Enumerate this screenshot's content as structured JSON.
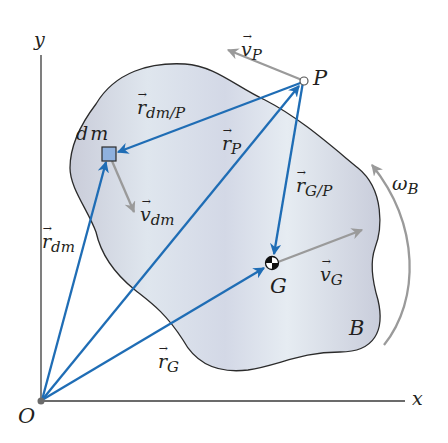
{
  "figure": {
    "axes": {
      "x_label": "x",
      "y_label": "y",
      "origin_label": "O"
    },
    "body_label": "B",
    "points": {
      "dm": {
        "label": "dm"
      },
      "P": {
        "label": "P"
      },
      "G": {
        "label": "G"
      }
    },
    "vectors": {
      "r_dm": {
        "base": "r",
        "sub": "dm"
      },
      "r_P": {
        "base": "r",
        "sub": "P"
      },
      "r_G": {
        "base": "r",
        "sub": "G"
      },
      "r_dm_P": {
        "base": "r",
        "sub": "dm/P"
      },
      "r_G_P": {
        "base": "r",
        "sub": "G/P"
      },
      "v_P": {
        "base": "v",
        "sub": "P"
      },
      "v_dm": {
        "base": "v",
        "sub": "dm"
      },
      "v_G": {
        "base": "v",
        "sub": "G"
      }
    },
    "angular_velocity": {
      "base": "ω",
      "sub": "B"
    },
    "colors": {
      "position_vector": "#1f6db5",
      "velocity_vector": "#9a9a9a",
      "body_fill": "#dde3ec",
      "body_outline": "#2b2b2b",
      "dm_fill": "#8fb1de",
      "axis": "#3a3a3a"
    }
  }
}
